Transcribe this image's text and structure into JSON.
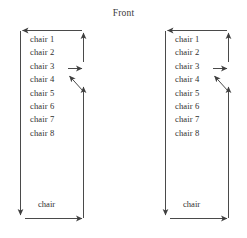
{
  "diagram": {
    "title": "Front",
    "type": "seating-flow-diagram",
    "stroke_color": "#4a4a4a",
    "text_color": "#2f2f2f",
    "background_color": "#ffffff",
    "panel_count": 2,
    "panels": [
      {
        "id": "left-row",
        "chairs": [
          "chair 1",
          "chair 2",
          "chair 3",
          "chair 4",
          "chair 5",
          "chair 6",
          "chair 7",
          "chair 8"
        ],
        "bottom_label": "chair",
        "arrows": [
          {
            "name": "top-horizontal-arrow",
            "direction": "left"
          },
          {
            "name": "right-upper-vertical-arrow",
            "direction": "up"
          },
          {
            "name": "chair3-right-arrow",
            "direction": "right"
          },
          {
            "name": "chair4-diagonal-arrow",
            "direction": "up-left"
          },
          {
            "name": "right-lower-vertical-arrow",
            "direction": "up"
          },
          {
            "name": "left-vertical-arrow",
            "direction": "down"
          },
          {
            "name": "bottom-horizontal-arrow",
            "direction": "right"
          }
        ]
      },
      {
        "id": "right-row",
        "chairs": [
          "chair 1",
          "chair 2",
          "chair 3",
          "chair 4",
          "chair 5",
          "chair 6",
          "chair 7",
          "chair 8"
        ],
        "bottom_label": "chair",
        "arrows": [
          {
            "name": "top-horizontal-arrow",
            "direction": "left"
          },
          {
            "name": "right-upper-vertical-arrow",
            "direction": "up"
          },
          {
            "name": "chair3-right-arrow",
            "direction": "right"
          },
          {
            "name": "chair4-diagonal-arrow",
            "direction": "up-left"
          },
          {
            "name": "right-lower-vertical-arrow",
            "direction": "up"
          },
          {
            "name": "left-vertical-arrow",
            "direction": "down"
          },
          {
            "name": "bottom-horizontal-arrow",
            "direction": "right"
          }
        ]
      }
    ]
  }
}
